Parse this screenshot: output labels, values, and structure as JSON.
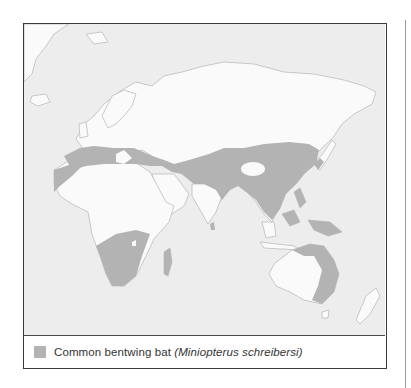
{
  "map": {
    "title": "",
    "region": "Eastern Hemisphere: Europe, Africa, Asia, Australia",
    "colors": {
      "ocean": "#ededed",
      "land": "#fafafa",
      "coast": "#bdbdbd",
      "range": "#b3b3b3",
      "frame": "#3a3a3a"
    }
  },
  "legend": {
    "common_name": "Common bentwing bat ",
    "scientific_name": "(Miniopterus schreibersi)",
    "swatch_color": "#b3b3b3"
  }
}
